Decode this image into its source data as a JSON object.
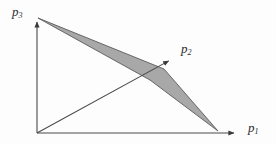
{
  "figure": {
    "title": "",
    "background_color": "#fdfdfd",
    "line_color": "#4a4a4a",
    "fill_color": "#a8a8a8",
    "fill_stroke_color": "#5a5a5a"
  },
  "axes": [
    {
      "id": "p3",
      "symbol": "p",
      "subscript": "3",
      "label": "p3",
      "direction": "up",
      "origin": [
        37,
        133
      ],
      "tip": [
        37,
        16
      ]
    },
    {
      "id": "p2",
      "symbol": "p",
      "subscript": "2",
      "label": "p2",
      "direction": "up-right-diagonal",
      "origin": [
        37,
        133
      ],
      "tip": [
        174,
        58
      ]
    },
    {
      "id": "p1",
      "symbol": "p",
      "subscript": "1",
      "label": "p1",
      "direction": "right",
      "origin": [
        37,
        133
      ],
      "tip": [
        240,
        133
      ]
    }
  ],
  "shaded_region": {
    "name": "shaded-quadrilateral",
    "shape": "quadrilateral",
    "vertices": [
      [
        38,
        18
      ],
      [
        164,
        69
      ],
      [
        218,
        131
      ],
      [
        150,
        80
      ]
    ],
    "fill": "#a8a8a8",
    "stroke": "#5a5a5a",
    "opacity": 1
  },
  "chart_data": {
    "type": "scatter",
    "title": "",
    "xlabel": "p1",
    "ylabel": "p3",
    "series": [
      {
        "name": "p3-axis",
        "x": [
          0,
          0
        ],
        "y": [
          0,
          1
        ]
      },
      {
        "name": "p1-axis",
        "x": [
          0,
          1
        ],
        "y": [
          0,
          0
        ]
      },
      {
        "name": "p2-ray",
        "x": [
          0,
          0.675
        ],
        "y": [
          0,
          0.641
        ]
      },
      {
        "name": "shaded-region-boundary",
        "x": [
          0.005,
          0.625,
          0.891,
          0.557,
          0.005
        ],
        "y": [
          0.983,
          0.547,
          0.017,
          0.453,
          0.983
        ]
      }
    ],
    "legend": [],
    "grid": false,
    "xlim": [
      0,
      1
    ],
    "ylim": [
      0,
      1
    ]
  }
}
